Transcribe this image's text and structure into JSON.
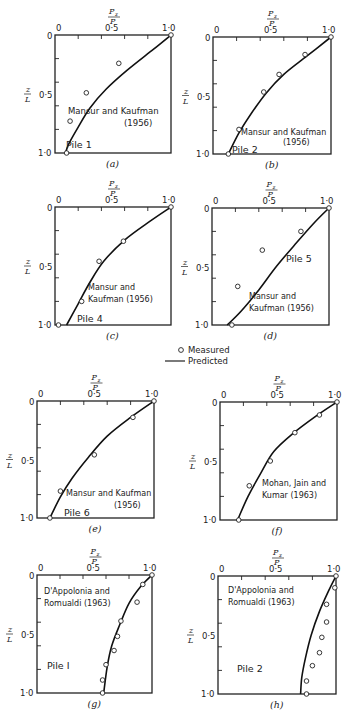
{
  "figure": {
    "legend": {
      "measured": "Measured",
      "predicted": "Predicted"
    },
    "x_axis_label_num": "Pz",
    "x_axis_label_den": "P",
    "y_axis_label_num": "z",
    "y_axis_label_den": "L"
  },
  "chart_data": [
    {
      "id": "a",
      "type": "line",
      "panel_label": "(a)",
      "source": "Mansur and Kaufman",
      "year": "(1956)",
      "pile": "Pile 1",
      "xlabel": "Pz/P",
      "ylabel": "z/L",
      "xlim": [
        0,
        1.0
      ],
      "ylim": [
        0,
        1.0
      ],
      "y_inverted": true,
      "xticks": [
        "0",
        "0·5",
        "1·0"
      ],
      "yticks": [
        "0",
        "0·5",
        "1·0"
      ],
      "box": [
        55,
        35,
        171,
        153
      ],
      "predicted": [
        [
          1.0,
          0
        ],
        [
          0.85,
          0.12
        ],
        [
          0.62,
          0.3
        ],
        [
          0.44,
          0.46
        ],
        [
          0.3,
          0.62
        ],
        [
          0.2,
          0.78
        ],
        [
          0.12,
          0.92
        ],
        [
          0.09,
          1.0
        ]
      ],
      "measured": [
        [
          1.0,
          0
        ],
        [
          0.55,
          0.24
        ],
        [
          0.27,
          0.49
        ],
        [
          0.13,
          0.73
        ],
        [
          0.1,
          1.0
        ]
      ],
      "labels": [
        {
          "key": "source",
          "x": 68,
          "y": 114,
          "size": 8.5
        },
        {
          "key": "year",
          "x": 124,
          "y": 126,
          "size": 8.5
        },
        {
          "key": "pile",
          "x": 66,
          "y": 148,
          "size": 9.5
        }
      ]
    },
    {
      "id": "b",
      "type": "line",
      "panel_label": "(b)",
      "source": "Mansur and Kaufman",
      "year": "(1956)",
      "pile": "Pile 2",
      "xlabel": "Pz/P",
      "ylabel": "z/L",
      "xlim": [
        0,
        1.0
      ],
      "ylim": [
        0,
        1.0
      ],
      "y_inverted": true,
      "xticks": [
        "0",
        "0·5",
        "1·0"
      ],
      "yticks": [
        "0",
        "0·5",
        "1·0"
      ],
      "box": [
        213,
        37,
        331,
        154
      ],
      "predicted": [
        [
          1.0,
          0
        ],
        [
          0.8,
          0.16
        ],
        [
          0.6,
          0.32
        ],
        [
          0.45,
          0.48
        ],
        [
          0.32,
          0.66
        ],
        [
          0.22,
          0.82
        ],
        [
          0.13,
          1.0
        ]
      ],
      "measured": [
        [
          1.0,
          0
        ],
        [
          0.78,
          0.15
        ],
        [
          0.56,
          0.32
        ],
        [
          0.43,
          0.47
        ],
        [
          0.22,
          0.79
        ],
        [
          0.13,
          1.0
        ]
      ],
      "labels": [
        {
          "key": "source",
          "x": 241,
          "y": 135,
          "size": 8
        },
        {
          "key": "year",
          "x": 283,
          "y": 145,
          "size": 8
        },
        {
          "key": "pile",
          "x": 232,
          "y": 153,
          "size": 9.5
        }
      ]
    },
    {
      "id": "c",
      "type": "line",
      "panel_label": "(c)",
      "source_line1": "Mansur and",
      "source_line2": "Kaufman (1956)",
      "pile": "Pile 4",
      "xlabel": "Pz/P",
      "ylabel": "z/L",
      "xlim": [
        0,
        1.0
      ],
      "ylim": [
        0,
        1.0
      ],
      "y_inverted": true,
      "xticks": [
        "0",
        "0·5",
        "1·0"
      ],
      "yticks": [
        "0",
        "0·5",
        "1·0"
      ],
      "box": [
        55,
        207,
        171,
        325
      ],
      "predicted": [
        [
          1.0,
          0
        ],
        [
          0.82,
          0.12
        ],
        [
          0.6,
          0.28
        ],
        [
          0.42,
          0.46
        ],
        [
          0.3,
          0.64
        ],
        [
          0.2,
          0.82
        ],
        [
          0.1,
          1.0
        ]
      ],
      "measured": [
        [
          1.0,
          0
        ],
        [
          0.59,
          0.29
        ],
        [
          0.38,
          0.46
        ],
        [
          0.23,
          0.8
        ],
        [
          0.03,
          1.0
        ]
      ],
      "labels": [
        {
          "key": "source_line1",
          "x": 88,
          "y": 290,
          "size": 8
        },
        {
          "key": "source_line2",
          "x": 88,
          "y": 302,
          "size": 8
        },
        {
          "key": "pile",
          "x": 77,
          "y": 322,
          "size": 9.5
        }
      ]
    },
    {
      "id": "d",
      "type": "line",
      "panel_label": "(d)",
      "source_line1": "Mansur and",
      "source_line2": "Kaufman (1956)",
      "pile": "Pile 5",
      "xlabel": "Pz/P",
      "ylabel": "z/L",
      "xlim": [
        0,
        1.0
      ],
      "ylim": [
        0,
        1.0
      ],
      "y_inverted": true,
      "xticks": [
        "0",
        "0·5",
        "1·0"
      ],
      "yticks": [
        "0",
        "0·5",
        "1·0"
      ],
      "box": [
        212,
        208,
        329,
        325
      ],
      "predicted": [
        [
          1.0,
          0
        ],
        [
          0.88,
          0.12
        ],
        [
          0.72,
          0.3
        ],
        [
          0.55,
          0.5
        ],
        [
          0.4,
          0.7
        ],
        [
          0.25,
          0.88
        ],
        [
          0.13,
          1.0
        ]
      ],
      "measured": [
        [
          1.0,
          0
        ],
        [
          0.76,
          0.2
        ],
        [
          0.43,
          0.36
        ],
        [
          0.22,
          0.67
        ],
        [
          0.17,
          1.0
        ]
      ],
      "labels": [
        {
          "key": "pile",
          "x": 286,
          "y": 262,
          "size": 9.5
        },
        {
          "key": "source_line1",
          "x": 249,
          "y": 299,
          "size": 8
        },
        {
          "key": "source_line2",
          "x": 249,
          "y": 311,
          "size": 8
        }
      ]
    },
    {
      "id": "e",
      "type": "line",
      "panel_label": "(e)",
      "source": "Mansur and Kaufman",
      "year": "(1956)",
      "pile": "Pile 6",
      "xlabel": "Pz/P",
      "ylabel": "z/L",
      "xlim": [
        0,
        1.0
      ],
      "ylim": [
        0,
        1.0
      ],
      "y_inverted": true,
      "xticks": [
        "0",
        "0·5",
        "1·0"
      ],
      "yticks": [
        "0",
        "0·5",
        "1·0"
      ],
      "box": [
        37,
        401,
        154,
        518
      ],
      "predicted": [
        [
          1.0,
          0
        ],
        [
          0.8,
          0.14
        ],
        [
          0.6,
          0.3
        ],
        [
          0.44,
          0.48
        ],
        [
          0.3,
          0.66
        ],
        [
          0.2,
          0.82
        ],
        [
          0.11,
          1.0
        ]
      ],
      "measured": [
        [
          1.0,
          0
        ],
        [
          0.82,
          0.14
        ],
        [
          0.49,
          0.46
        ],
        [
          0.2,
          0.77
        ],
        [
          0.11,
          1.0
        ]
      ],
      "labels": [
        {
          "key": "source",
          "x": 66,
          "y": 496,
          "size": 8
        },
        {
          "key": "year",
          "x": 114,
          "y": 508,
          "size": 8
        },
        {
          "key": "pile",
          "x": 64,
          "y": 516,
          "size": 9.5
        }
      ]
    },
    {
      "id": "f",
      "type": "line",
      "panel_label": "(f)",
      "source_line1": "Mohan, Jain and",
      "source_line2": "Kumar  (1963)",
      "xlabel": "Pz/P",
      "ylabel": "z/L",
      "xlim": [
        0,
        1.0
      ],
      "ylim": [
        0,
        1.0
      ],
      "y_inverted": true,
      "xticks": [
        "0",
        "0·5",
        "1·0"
      ],
      "yticks": [
        "0",
        "0·5",
        "1·0"
      ],
      "box": [
        220,
        402,
        337,
        520
      ],
      "predicted": [
        [
          1.0,
          0
        ],
        [
          0.82,
          0.12
        ],
        [
          0.62,
          0.27
        ],
        [
          0.46,
          0.42
        ],
        [
          0.35,
          0.6
        ],
        [
          0.24,
          0.8
        ],
        [
          0.15,
          1.0
        ]
      ],
      "measured": [
        [
          1.0,
          0
        ],
        [
          0.85,
          0.11
        ],
        [
          0.64,
          0.26
        ],
        [
          0.43,
          0.5
        ],
        [
          0.25,
          0.71
        ],
        [
          0.16,
          1.0
        ]
      ],
      "labels": [
        {
          "key": "source_line1",
          "x": 262,
          "y": 486,
          "size": 8
        },
        {
          "key": "source_line2",
          "x": 262,
          "y": 498,
          "size": 8
        }
      ]
    },
    {
      "id": "g",
      "type": "line",
      "panel_label": "(g)",
      "source_line1": "D'Appolonia  and",
      "source_line2": "Romualdi (1963)",
      "pile": "Pile I",
      "xlabel": "Pz/P",
      "ylabel": "z/L",
      "xlim": [
        0,
        1.0
      ],
      "ylim": [
        0,
        1.0
      ],
      "y_inverted": true,
      "xticks": [
        "0",
        "0·5",
        "1·0"
      ],
      "yticks": [
        "0",
        "0·5",
        "1·0"
      ],
      "box": [
        37,
        575,
        152,
        693
      ],
      "predicted": [
        [
          1.0,
          0
        ],
        [
          0.9,
          0.1
        ],
        [
          0.8,
          0.24
        ],
        [
          0.72,
          0.42
        ],
        [
          0.65,
          0.6
        ],
        [
          0.61,
          0.78
        ],
        [
          0.58,
          1.0
        ]
      ],
      "measured": [
        [
          1.0,
          0
        ],
        [
          0.92,
          0.08
        ],
        [
          0.87,
          0.23
        ],
        [
          0.73,
          0.39
        ],
        [
          0.7,
          0.52
        ],
        [
          0.67,
          0.64
        ],
        [
          0.6,
          0.76
        ],
        [
          0.57,
          0.89
        ],
        [
          0.57,
          1.0
        ]
      ],
      "labels": [
        {
          "key": "source_line1",
          "x": 44,
          "y": 594,
          "size": 8
        },
        {
          "key": "source_line2",
          "x": 44,
          "y": 606,
          "size": 8
        },
        {
          "key": "pile",
          "x": 47,
          "y": 669,
          "size": 9.5
        }
      ]
    },
    {
      "id": "h",
      "type": "line",
      "panel_label": "(h)",
      "source_line1": "D'Appolonia  and",
      "source_line2": "Romualdi (1963)",
      "pile": "Pile 2",
      "xlabel": "Pz/P",
      "ylabel": "z/L",
      "xlim": [
        0,
        1.0
      ],
      "ylim": [
        0,
        1.0
      ],
      "y_inverted": true,
      "xticks": [
        "0",
        "0·5",
        "1·0"
      ],
      "yticks": [
        "0",
        "0·5",
        "1·0"
      ],
      "box": [
        218,
        576,
        336,
        694
      ],
      "predicted": [
        [
          1.0,
          0
        ],
        [
          0.94,
          0.12
        ],
        [
          0.86,
          0.3
        ],
        [
          0.79,
          0.5
        ],
        [
          0.74,
          0.7
        ],
        [
          0.71,
          0.86
        ],
        [
          0.7,
          1.0
        ]
      ],
      "measured": [
        [
          1.0,
          0
        ],
        [
          0.99,
          0.1
        ],
        [
          0.92,
          0.24
        ],
        [
          0.92,
          0.39
        ],
        [
          0.88,
          0.52
        ],
        [
          0.86,
          0.65
        ],
        [
          0.8,
          0.76
        ],
        [
          0.75,
          0.89
        ],
        [
          0.75,
          1.0
        ]
      ],
      "labels": [
        {
          "key": "source_line1",
          "x": 228,
          "y": 593,
          "size": 8
        },
        {
          "key": "source_line2",
          "x": 228,
          "y": 605,
          "size": 8
        },
        {
          "key": "pile",
          "x": 237,
          "y": 672,
          "size": 9.5
        }
      ]
    }
  ]
}
